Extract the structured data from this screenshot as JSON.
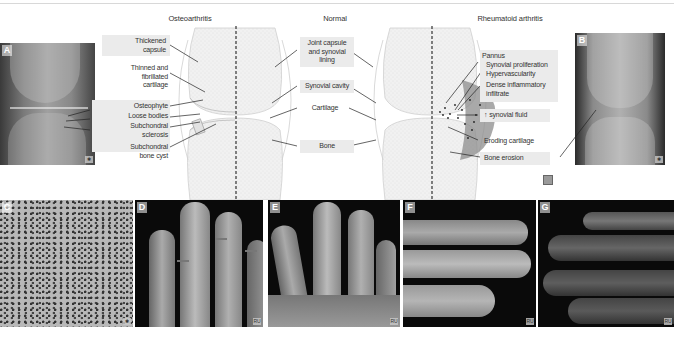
{
  "headings": {
    "osteoarthritis": "Osteoarthritis",
    "normal": "Normal",
    "rheumatoid": "Rheumatoid arthritis"
  },
  "oa_labels": [
    {
      "text": "Thickened\ncapsule",
      "boxed": true
    },
    {
      "text": "Thinned and\nfibrillated\ncartilage",
      "boxed": false
    },
    {
      "text": "Osteophyte",
      "boxed": true
    },
    {
      "text": "Loose bodies",
      "boxed": true
    },
    {
      "text": "Subchondral\nsclerosis",
      "boxed": true
    },
    {
      "text": "Subchondral\nbone cyst",
      "boxed": true
    }
  ],
  "normal_labels": [
    {
      "text": "Joint capsule\nand synovial\nlining",
      "boxed": true
    },
    {
      "text": "Synovial cavity",
      "boxed": true
    },
    {
      "text": "Cartilage",
      "boxed": false
    },
    {
      "text": "Bone",
      "boxed": true
    }
  ],
  "ra_labels": {
    "pannus": "Pannus",
    "synovial_proliferation": "Synovial proliferation",
    "hypervascularity": "Hypervascularity",
    "dense_infiltrate": "Dense inflammatory\ninfiltrate",
    "synovial_fluid": "↑ synovial fluid",
    "eroding_cartilage": "Eroding cartilage",
    "bone_erosion": "Bone erosion"
  },
  "panels": {
    "A": "A",
    "B": "B",
    "C": "C",
    "D": "D",
    "E": "E",
    "F": "F",
    "G": "G"
  },
  "corner_marks": {
    "A": "✱",
    "B": "✱",
    "C": "✱",
    "D": "RU",
    "E": "RU",
    "F": "RU",
    "G": "RU"
  },
  "colors": {
    "label_box": "#ebebeb",
    "bone_fill": "#efefef",
    "pannus": "#8c8c8c",
    "line": "#222222"
  }
}
